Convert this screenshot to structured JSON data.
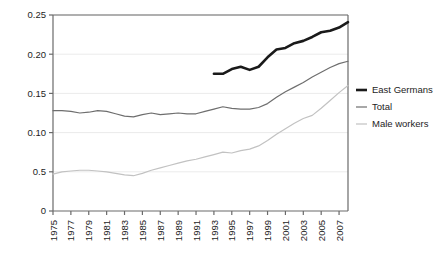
{
  "chart_data": {
    "type": "line",
    "title": "",
    "subtitle": "",
    "xlabel": "",
    "ylabel": "",
    "xlim": [
      1975,
      2008
    ],
    "ylim": [
      0,
      0.25
    ],
    "grid": true,
    "grid_orientation": "horizontal",
    "legend_position": "right",
    "y_ticks": [
      0,
      0.05,
      0.1,
      0.15,
      0.2,
      0.25
    ],
    "y_tick_labels": [
      "0",
      "0.5",
      "0.10",
      "0.15",
      "0.20",
      "0.25"
    ],
    "x_ticks": [
      1975,
      1977,
      1979,
      1981,
      1983,
      1985,
      1987,
      1989,
      1991,
      1993,
      1995,
      1997,
      1999,
      2001,
      2003,
      2005,
      2007
    ],
    "x_tick_labels": [
      "1975",
      "1977",
      "1979",
      "1981",
      "1983",
      "1985",
      "1987",
      "1989",
      "1991",
      "1993",
      "1995",
      "1997",
      "1999",
      "2001",
      "2003",
      "2005",
      "2007"
    ],
    "x": [
      1975,
      1976,
      1977,
      1978,
      1979,
      1980,
      1981,
      1982,
      1983,
      1984,
      1985,
      1986,
      1987,
      1988,
      1989,
      1990,
      1991,
      1992,
      1993,
      1994,
      1995,
      1996,
      1997,
      1998,
      1999,
      2000,
      2001,
      2002,
      2003,
      2004,
      2005,
      2006,
      2007,
      2008
    ],
    "series": [
      {
        "name": "East Germans",
        "color": "#1a1a1a",
        "width": 2.6,
        "x": [
          1993,
          1994,
          1995,
          1996,
          1997,
          1998,
          1999,
          2000,
          2001,
          2002,
          2003,
          2004,
          2005,
          2006,
          2007,
          2008
        ],
        "values": [
          0.175,
          0.175,
          0.181,
          0.184,
          0.18,
          0.184,
          0.196,
          0.206,
          0.208,
          0.214,
          0.217,
          0.222,
          0.228,
          0.23,
          0.234,
          0.241
        ]
      },
      {
        "name": "Total",
        "color": "#6e6e6e",
        "width": 1.2,
        "x": [
          1975,
          1976,
          1977,
          1978,
          1979,
          1980,
          1981,
          1982,
          1983,
          1984,
          1985,
          1986,
          1987,
          1988,
          1989,
          1990,
          1991,
          1992,
          1993,
          1994,
          1995,
          1996,
          1997,
          1998,
          1999,
          2000,
          2001,
          2002,
          2003,
          2004,
          2005,
          2006,
          2007,
          2008
        ],
        "values": [
          0.128,
          0.128,
          0.127,
          0.125,
          0.126,
          0.128,
          0.127,
          0.124,
          0.121,
          0.12,
          0.123,
          0.125,
          0.123,
          0.124,
          0.125,
          0.124,
          0.124,
          0.127,
          0.13,
          0.133,
          0.131,
          0.13,
          0.13,
          0.132,
          0.137,
          0.145,
          0.152,
          0.158,
          0.164,
          0.171,
          0.177,
          0.183,
          0.188,
          0.191
        ]
      },
      {
        "name": "Male workers",
        "color": "#c2c2c2",
        "width": 1.2,
        "x": [
          1975,
          1976,
          1977,
          1978,
          1979,
          1980,
          1981,
          1982,
          1983,
          1984,
          1985,
          1986,
          1987,
          1988,
          1989,
          1990,
          1991,
          1992,
          1993,
          1994,
          1995,
          1996,
          1997,
          1998,
          1999,
          2000,
          2001,
          2002,
          2003,
          2004,
          2005,
          2006,
          2007,
          2008
        ],
        "values": [
          0.047,
          0.05,
          0.051,
          0.052,
          0.052,
          0.051,
          0.05,
          0.048,
          0.046,
          0.045,
          0.048,
          0.052,
          0.055,
          0.058,
          0.061,
          0.064,
          0.066,
          0.069,
          0.072,
          0.075,
          0.074,
          0.077,
          0.079,
          0.083,
          0.09,
          0.098,
          0.105,
          0.112,
          0.118,
          0.122,
          0.131,
          0.141,
          0.151,
          0.16
        ]
      }
    ]
  },
  "legend": {
    "items": [
      {
        "label": "East Germans"
      },
      {
        "label": "Total"
      },
      {
        "label": "Male workers"
      }
    ]
  },
  "axes": {
    "frame_color": "#6a6a6a",
    "gridline_color": "#ebebeb"
  }
}
